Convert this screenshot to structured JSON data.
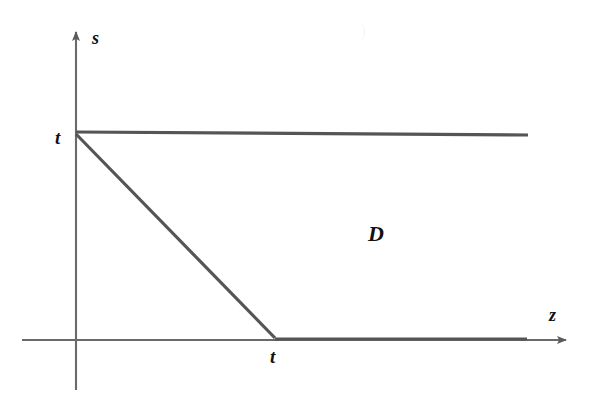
{
  "figure": {
    "type": "diagram",
    "kind": "cartesian-region-sketch",
    "background_color": "#ffffff",
    "axis_color": "#6a6a6a",
    "boundary_color": "#555555",
    "label_color": "#111111",
    "axes": {
      "horizontal": {
        "name": "z-axis",
        "label": "z",
        "label_position": {
          "x": 555,
          "y": 315
        },
        "start": {
          "x": 22,
          "y": 340
        },
        "end": {
          "x": 572,
          "y": 340
        },
        "arrow": "right"
      },
      "vertical": {
        "name": "s-axis",
        "label": "s",
        "label_position": {
          "x": 97,
          "y": 38
        },
        "start": {
          "x": 76,
          "y": 390
        },
        "end": {
          "x": 76,
          "y": 28
        },
        "arrow": "up"
      },
      "origin": {
        "x": 76,
        "y": 340
      }
    },
    "ticks": [
      {
        "name": "s-axis-tick-t",
        "label": "t",
        "axis": "vertical",
        "position": {
          "x": 60,
          "y": 138
        }
      },
      {
        "name": "z-axis-tick-t",
        "label": "t",
        "axis": "horizontal",
        "position": {
          "x": 276,
          "y": 358
        }
      }
    ],
    "region": {
      "name": "region-D",
      "label": "D",
      "label_position": {
        "x": 375,
        "y": 235
      },
      "boundary_segments": [
        {
          "name": "top-boundary",
          "from": {
            "x": 76,
            "y": 132
          },
          "to": {
            "x": 528,
            "y": 135
          }
        },
        {
          "name": "diagonal-boundary",
          "from": {
            "x": 76,
            "y": 134
          },
          "to": {
            "x": 275,
            "y": 338
          }
        },
        {
          "name": "bottom-boundary",
          "from": {
            "x": 275,
            "y": 339
          },
          "to": {
            "x": 527,
            "y": 339
          }
        }
      ],
      "stroke_width": 3.2
    },
    "artifact": {
      "name": "scan-artifact",
      "position": {
        "x": 362,
        "y": 30
      }
    }
  }
}
